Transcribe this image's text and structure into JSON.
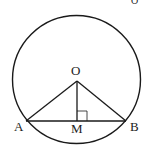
{
  "diagram": {
    "corner_label": "O",
    "circle": {
      "cx": 76.5,
      "cy": 79.5,
      "r": 64
    },
    "points": {
      "O": {
        "label": "O",
        "x": 77,
        "y": 81
      },
      "A": {
        "label": "A",
        "x": 26,
        "y": 121
      },
      "B": {
        "label": "B",
        "x": 126,
        "y": 121
      },
      "M": {
        "label": "M",
        "x": 77,
        "y": 121
      }
    },
    "segments": [
      "OA",
      "OB",
      "OM",
      "AB"
    ],
    "right_angle_at": "M",
    "colors": {
      "stroke": "#1a1a1a",
      "background": "#ffffff",
      "text": "#222222"
    }
  }
}
